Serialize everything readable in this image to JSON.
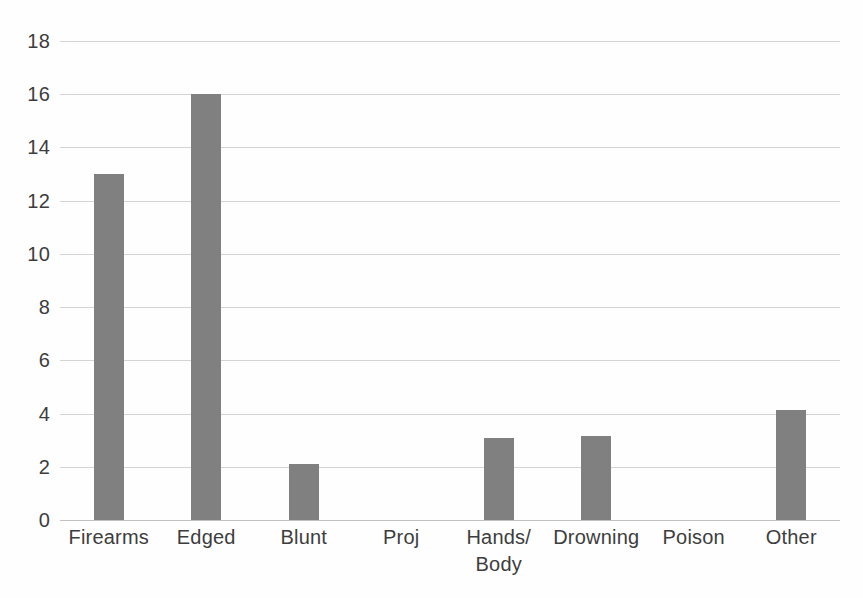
{
  "chart_data": {
    "type": "bar",
    "title": "",
    "subtitle": "",
    "xlabel": "",
    "ylabel": "",
    "categories": [
      "Firearms",
      "Edged",
      "Blunt",
      "Proj",
      "Hands/\nBody",
      "Drowning",
      "Poison",
      "Other"
    ],
    "values": [
      13,
      16,
      2.1,
      0,
      3.1,
      3.15,
      0,
      4.15
    ],
    "ylim": [
      0,
      18
    ],
    "ytick_values": [
      0,
      2,
      4,
      6,
      8,
      10,
      12,
      14,
      16,
      18
    ],
    "ytick_labels": [
      "0",
      "2",
      "4",
      "6",
      "8",
      "10",
      "12",
      "14",
      "16",
      "18"
    ],
    "grid": true,
    "grid_axis": "y",
    "legend": false,
    "legend_position": "none",
    "series": [
      {
        "name": "",
        "color": "#808080",
        "values": [
          13,
          16,
          2.1,
          0,
          3.1,
          3.15,
          0,
          4.15
        ]
      }
    ]
  },
  "style": {
    "bar_color": "#808080",
    "gridline_color": "#d4d4d4",
    "baseline_color": "#c2c2c2",
    "text_color": "#3d3d3d",
    "background": "#fefefe"
  }
}
